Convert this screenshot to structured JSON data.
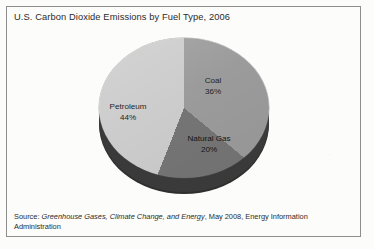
{
  "title": "U.S. Carbon Dioxide Emissions by Fuel Type, 2006",
  "source": {
    "prefix": "Source: ",
    "publication": "Greenhouse Gases, Climate Change, and Energy",
    "suffix": ", May 2008, Energy Information Administration"
  },
  "colors": {
    "coal": "#9b9b9b",
    "natural_gas": "#757575",
    "petroleum": "#cccccc",
    "pie_side": "#3a3a3a",
    "frame": "#8e8e8e",
    "text": "#2b2b2b",
    "background": "#fcfcfa"
  },
  "labels": {
    "coal_name": "Coal",
    "coal_pct": "36%",
    "petroleum_name": "Petroleum",
    "petroleum_pct": "44%",
    "natural_gas_name": "Natural Gas",
    "natural_gas_pct": "20%"
  },
  "chart_data": {
    "type": "pie",
    "title": "U.S. Carbon Dioxide Emissions by Fuel Type, 2006",
    "subtitle": "",
    "xlabel": "",
    "ylabel": "",
    "unit": "percent",
    "three_d": true,
    "start_angle_deg": 0,
    "direction": "clockwise",
    "legend": "none (slices labeled directly)",
    "grid": false,
    "categories": [
      "Coal",
      "Natural Gas",
      "Petroleum"
    ],
    "values": [
      36,
      20,
      44
    ],
    "slices": [
      {
        "label": "Coal",
        "value": 36,
        "display": "36%",
        "color": "#9b9b9b",
        "start_deg": 0,
        "end_deg": 129.6
      },
      {
        "label": "Natural Gas",
        "value": 20,
        "display": "20%",
        "color": "#757575",
        "start_deg": 129.6,
        "end_deg": 201.6
      },
      {
        "label": "Petroleum",
        "value": 44,
        "display": "44%",
        "color": "#cccccc",
        "start_deg": 201.6,
        "end_deg": 360
      }
    ],
    "total": 100,
    "annotations": [
      "Source: Greenhouse Gases, Climate Change, and Energy, May 2008, Energy Information Administration"
    ]
  }
}
